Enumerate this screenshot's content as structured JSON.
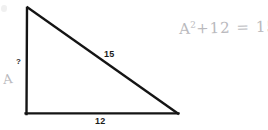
{
  "page": {
    "background_color": "#ffffff",
    "width": 268,
    "height": 130
  },
  "figure": {
    "name": "right-triangle",
    "stroke_color": "#141414",
    "vertices": {
      "apex": {
        "x": 27,
        "y": 7
      },
      "right_angle": {
        "x": 26,
        "y": 114
      },
      "base_right": {
        "x": 178,
        "y": 114
      }
    },
    "sides": [
      {
        "name": "vertical-leg",
        "label": "?",
        "from": "apex",
        "to": "right_angle"
      },
      {
        "name": "hypotenuse",
        "label": "15",
        "from": "apex",
        "to": "base_right"
      },
      {
        "name": "base-leg",
        "label": "12",
        "from": "right_angle",
        "to": "base_right"
      }
    ]
  },
  "labels": {
    "hypotenuse": "15",
    "base": "12",
    "unknown": "?"
  },
  "annotations": {
    "leg_variable": "A",
    "equation": {
      "base": "A",
      "exponent": "2",
      "rest": "+12 = 15"
    },
    "pencil_color": "#b9b9bd"
  }
}
